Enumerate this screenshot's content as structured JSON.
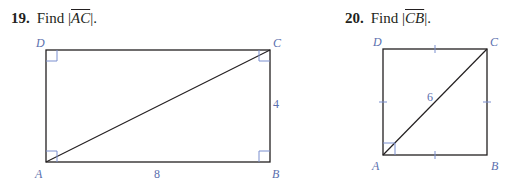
{
  "problems": [
    {
      "number": "19.",
      "prompt_prefix": "Find |",
      "segment": "AC",
      "prompt_suffix": "|.",
      "figure": {
        "shape": "rectangle",
        "vertices": {
          "D": "D",
          "C": "C",
          "A": "A",
          "B": "B"
        },
        "side_label_right": "4",
        "side_label_bottom": "8",
        "diagonal": "AC",
        "right_angles": [
          "D",
          "C",
          "A",
          "B"
        ]
      }
    },
    {
      "number": "20.",
      "prompt_prefix": "Find |",
      "segment": "CB",
      "prompt_suffix": "|.",
      "figure": {
        "shape": "square",
        "vertices": {
          "D": "D",
          "C": "C",
          "A": "A",
          "B": "B"
        },
        "diagonal_label": "6",
        "diagonal": "AC",
        "congruent_tick_marks": 4,
        "right_angles": [
          "A"
        ]
      }
    }
  ],
  "colors": {
    "line": "#231f20",
    "label": "#5b6fae",
    "marker": "#7b8fcf"
  }
}
